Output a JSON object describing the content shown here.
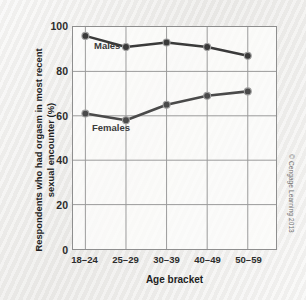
{
  "chart_data": {
    "type": "line",
    "title": "",
    "xlabel": "Age bracket",
    "ylabel_line1": "Respondents who had orgasm in most recent",
    "ylabel_line2": "sexual encounter (%)",
    "categories": [
      "18–24",
      "25–29",
      "30–39",
      "40–49",
      "50–59"
    ],
    "yticks": [
      "0",
      "20",
      "40",
      "60",
      "80",
      "100"
    ],
    "ylim": [
      0,
      100
    ],
    "grid": true,
    "legend_position": "inline-labels",
    "series": [
      {
        "name": "Males",
        "values": [
          96,
          91,
          93,
          91,
          87
        ],
        "color": "#3a3a3a",
        "marker": "circle"
      },
      {
        "name": "Females",
        "values": [
          61,
          58,
          65,
          69,
          71
        ],
        "color": "#4a4a4a",
        "marker": "circle"
      }
    ]
  },
  "credit": "© Cengage Learning 2013",
  "colors": {
    "background": "#efeeec",
    "plot_background": "#fcfcfb",
    "gridline": "#9a9a9a",
    "axis": "#8e8e8e",
    "line": "#3a3a3a",
    "text": "#1e1e1e"
  }
}
